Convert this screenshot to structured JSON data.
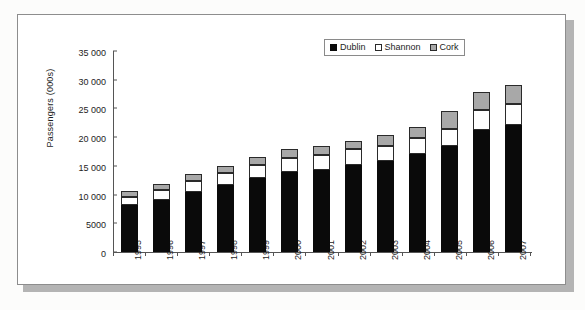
{
  "chart_data": {
    "type": "bar",
    "subtype": "stacked",
    "title": "",
    "xlabel": "",
    "ylabel": "Passengers (000s)",
    "ylim": [
      0,
      35000
    ],
    "ytick_step": 5000,
    "ytick_labels": [
      "0",
      "5000",
      "10 000",
      "15 000",
      "20 000",
      "25 000",
      "30 000",
      "35 000"
    ],
    "ytick_values": [
      0,
      5000,
      10000,
      15000,
      20000,
      25000,
      30000,
      35000
    ],
    "grid": false,
    "legend_position": "top-right",
    "categories": [
      "1995",
      "1996",
      "1997",
      "1998",
      "1999",
      "2000",
      "2001",
      "2002",
      "2003",
      "2004",
      "2005",
      "2006",
      "2007"
    ],
    "series": [
      {
        "name": "Dublin",
        "color": "#0a0a0a",
        "values": [
          8100,
          9100,
          10400,
          11700,
          12900,
          13900,
          14300,
          15100,
          15800,
          17100,
          18400,
          21200,
          22200
        ]
      },
      {
        "name": "Shannon",
        "color": "#ffffff",
        "values": [
          1500,
          1700,
          1900,
          2100,
          2300,
          2500,
          2600,
          2900,
          2600,
          2800,
          3000,
          3600,
          3600
        ]
      },
      {
        "name": "Cork",
        "color": "#a8a8a8",
        "values": [
          950,
          1100,
          1200,
          1100,
          1300,
          1600,
          1600,
          1400,
          2000,
          1900,
          3100,
          3000,
          3200
        ]
      }
    ],
    "totals": [
      10550,
      11900,
      13500,
      14900,
      16500,
      18000,
      18500,
      19400,
      20400,
      21800,
      24500,
      27800,
      29000
    ]
  },
  "legend": {
    "items": [
      {
        "label": "Dublin",
        "swatch": "filled-black-square-icon"
      },
      {
        "label": "Shannon",
        "swatch": "empty-white-square-icon"
      },
      {
        "label": "Cork",
        "swatch": "filled-gray-square-icon"
      }
    ]
  },
  "colors": {
    "dublin": "#0a0a0a",
    "shannon": "#ffffff",
    "cork": "#a8a8a8",
    "axis": "#555555",
    "frame_border": "#8d8d8d",
    "page_background": "#fcfcfb",
    "shadow": "#b4b4b4"
  }
}
